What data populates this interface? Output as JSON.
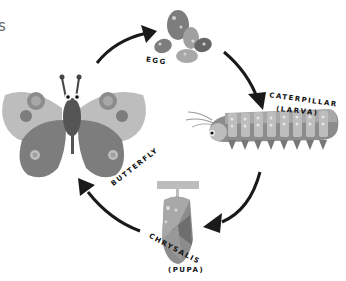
{
  "diagram": {
    "type": "life-cycle",
    "stages": [
      {
        "id": "egg",
        "label": "EGG"
      },
      {
        "id": "caterpillar",
        "label": "CATERPILLAR",
        "sublabel": "(LARVA)"
      },
      {
        "id": "chrysalis",
        "label": "CHRYSALIS",
        "sublabel": "(PUPA)"
      },
      {
        "id": "butterfly",
        "label": "BUTTERFLY"
      }
    ],
    "edges": [
      {
        "from": "butterfly",
        "to": "egg"
      },
      {
        "from": "egg",
        "to": "caterpillar"
      },
      {
        "from": "caterpillar",
        "to": "chrysalis"
      },
      {
        "from": "chrysalis",
        "to": "butterfly"
      }
    ],
    "left_edge_fragment": "s"
  },
  "colors": {
    "arrow": "#1a1a1a",
    "dark_gray": "#555555",
    "mid_gray": "#7d7d7d",
    "light_gray": "#a8a8a8",
    "pale_gray": "#cfcfcf"
  }
}
